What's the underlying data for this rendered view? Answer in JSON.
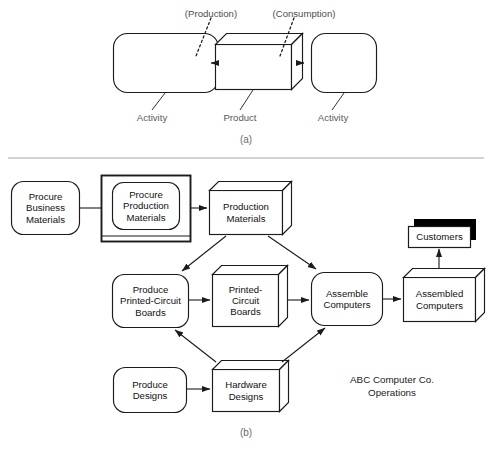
{
  "figure": {
    "panels": [
      {
        "id": "a",
        "label": "(a)",
        "title_visible": false
      },
      {
        "id": "b",
        "label": "(b)",
        "title_visible": false
      }
    ]
  },
  "panel_a": {
    "caption": "(a)",
    "nodes": [
      {
        "id": "activity-left",
        "type": "activity",
        "label": ""
      },
      {
        "id": "product-center",
        "type": "product",
        "label": ""
      },
      {
        "id": "activity-right",
        "type": "activity",
        "label": ""
      }
    ],
    "annotations": [
      {
        "id": "production-annot",
        "text": "(Production)"
      },
      {
        "id": "consumption-annot",
        "text": "(Consumption)"
      }
    ],
    "callouts": [
      {
        "id": "callout-activity-left",
        "text": "Activity"
      },
      {
        "id": "callout-product",
        "text": "Product"
      },
      {
        "id": "callout-activity-right",
        "text": "Activity"
      }
    ]
  },
  "panel_b": {
    "caption": "(b)",
    "free_text": "ABC Computer Co.\nOperations",
    "nodes": [
      {
        "id": "procure-business-materials",
        "type": "activity",
        "label": "Procure\nBusiness\nMaterials"
      },
      {
        "id": "procure-production-materials",
        "type": "activity-framed",
        "label": "Procure\nProduction\nMaterials"
      },
      {
        "id": "production-materials",
        "type": "product",
        "label": "Production\nMaterials"
      },
      {
        "id": "produce-printed-circuit-boards",
        "type": "activity",
        "label": "Produce\nPrinted-Circuit\nBoards"
      },
      {
        "id": "printed-circuit-boards",
        "type": "product",
        "label": "Printed-\nCircuit\nBoards"
      },
      {
        "id": "assemble-computers",
        "type": "activity",
        "label": "Assemble\nComputers"
      },
      {
        "id": "assembled-computers",
        "type": "product",
        "label": "Assembled\nComputers"
      },
      {
        "id": "customers",
        "type": "external",
        "label": "Customers"
      },
      {
        "id": "produce-designs",
        "type": "activity",
        "label": "Produce\nDesigns"
      },
      {
        "id": "hardware-designs",
        "type": "product",
        "label": "Hardware\nDesigns"
      }
    ],
    "edges": [
      {
        "from": "procure-business-materials",
        "to": "procure-production-materials"
      },
      {
        "from": "procure-production-materials",
        "to": "production-materials"
      },
      {
        "from": "production-materials",
        "to": "produce-printed-circuit-boards"
      },
      {
        "from": "production-materials",
        "to": "assemble-computers"
      },
      {
        "from": "produce-printed-circuit-boards",
        "to": "printed-circuit-boards"
      },
      {
        "from": "printed-circuit-boards",
        "to": "assemble-computers"
      },
      {
        "from": "assemble-computers",
        "to": "assembled-computers"
      },
      {
        "from": "assembled-computers",
        "to": "customers"
      },
      {
        "from": "produce-designs",
        "to": "hardware-designs"
      },
      {
        "from": "hardware-designs",
        "to": "produce-printed-circuit-boards"
      },
      {
        "from": "hardware-designs",
        "to": "assemble-computers"
      }
    ]
  },
  "style": {
    "stroke": "#1b1b1b",
    "paper": "#ffffff",
    "caption_color": "#5a5a5a",
    "shadow_fill": "#000000"
  }
}
